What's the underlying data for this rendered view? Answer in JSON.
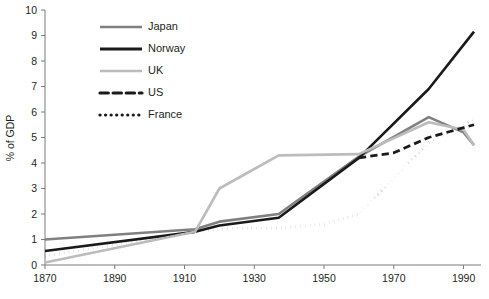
{
  "chart_data": {
    "type": "line",
    "title": "",
    "xlabel": "",
    "ylabel": "% of GDP",
    "xlim": [
      1870,
      1995
    ],
    "ylim": [
      0,
      10
    ],
    "xticks": [
      1870,
      1890,
      1910,
      1930,
      1950,
      1970,
      1990
    ],
    "yticks": [
      0,
      1,
      2,
      3,
      4,
      5,
      6,
      7,
      8,
      9,
      10
    ],
    "grid": false,
    "legend_position": "top-left-inside",
    "series": [
      {
        "name": "Japan",
        "color": "#808080",
        "style": "solid",
        "width": 2.6,
        "x": [
          1870,
          1913,
          1920,
          1937,
          1960,
          1980,
          1990,
          1993
        ],
        "y": [
          1.0,
          1.4,
          1.7,
          2.0,
          4.25,
          5.8,
          5.2,
          4.7
        ]
      },
      {
        "name": "Norway",
        "color": "#1a1a1a",
        "style": "solid",
        "width": 2.6,
        "x": [
          1870,
          1913,
          1920,
          1937,
          1960,
          1980,
          1993
        ],
        "y": [
          0.55,
          1.3,
          1.55,
          1.85,
          4.2,
          6.9,
          9.15
        ]
      },
      {
        "name": "UK",
        "color": "#bcbcbc",
        "style": "solid",
        "width": 2.6,
        "x": [
          1870,
          1913,
          1920,
          1937,
          1960,
          1980,
          1990,
          1993
        ],
        "y": [
          0.1,
          1.3,
          3.0,
          4.3,
          4.35,
          5.6,
          5.3,
          4.7
        ]
      },
      {
        "name": "US",
        "color": "#1a1a1a",
        "style": "dashed",
        "width": 2.8,
        "x": [
          1960,
          1970,
          1980,
          1993
        ],
        "y": [
          4.2,
          4.4,
          5.0,
          5.5
        ]
      },
      {
        "name": "France",
        "color": "#1a1a1a",
        "style": "dotted",
        "width": 2.8,
        "x": [
          1870,
          1913,
          1925,
          1937,
          1950,
          1960,
          1970,
          1980,
          1993
        ],
        "y": [
          0.35,
          1.3,
          1.45,
          1.45,
          1.6,
          2.0,
          3.4,
          4.8,
          5.7
        ]
      }
    ],
    "legend": [
      {
        "label": "Japan",
        "color": "#808080",
        "style": "solid"
      },
      {
        "label": "Norway",
        "color": "#1a1a1a",
        "style": "solid"
      },
      {
        "label": "UK",
        "color": "#bcbcbc",
        "style": "solid"
      },
      {
        "label": "US",
        "color": "#1a1a1a",
        "style": "dashed"
      },
      {
        "label": "France",
        "color": "#1a1a1a",
        "style": "dotted"
      }
    ]
  }
}
